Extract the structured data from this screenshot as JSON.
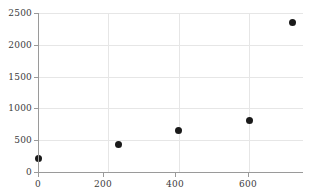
{
  "chart_data": {
    "type": "scatter",
    "title": "",
    "subtitle": "",
    "xlabel": "",
    "ylabel": "",
    "xlim": [
      0,
      753
    ],
    "ylim": [
      0,
      2500
    ],
    "grid": true,
    "legend": null,
    "x_ticks": [
      0,
      200,
      400,
      600
    ],
    "x_tick_labels": [
      "0",
      "200",
      "400",
      "600"
    ],
    "y_ticks": [
      0,
      500,
      1000,
      1500,
      2000,
      2500
    ],
    "y_tick_labels": [
      "0",
      "500",
      "1000",
      "1500",
      "2000",
      "2500"
    ],
    "marker": "filled-circle",
    "marker_color": "#1a1a1a",
    "grid_color": "#e6e6e6",
    "axis_color": "#9a9a9a",
    "tick_label_color": "#3b3b3b",
    "x": [
      0,
      230,
      400,
      600,
      722
    ],
    "y": [
      220,
      430,
      650,
      810,
      2350
    ],
    "points": [
      {
        "x": 0,
        "y": 220
      },
      {
        "x": 230,
        "y": 430
      },
      {
        "x": 400,
        "y": 650
      },
      {
        "x": 600,
        "y": 810
      },
      {
        "x": 722,
        "y": 2350
      }
    ]
  }
}
